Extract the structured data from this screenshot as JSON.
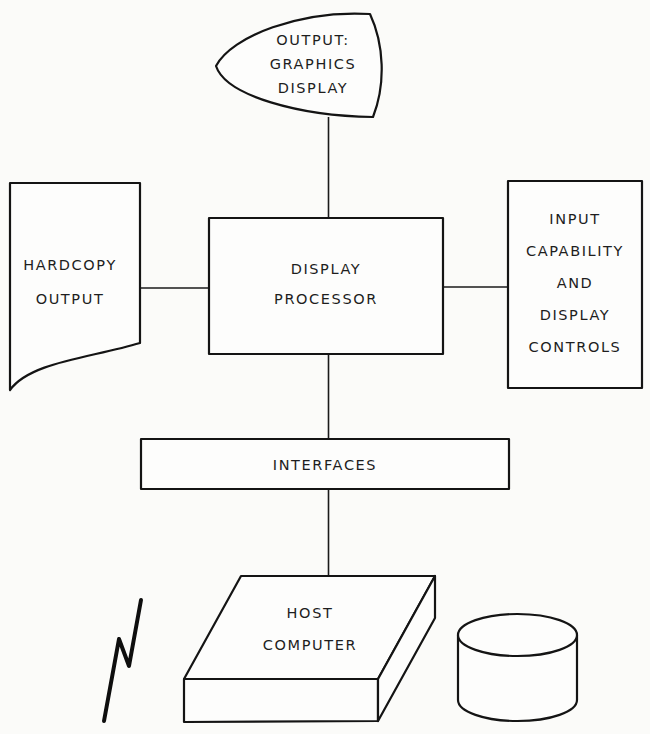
{
  "diagram": {
    "nodes": {
      "graphics_display": {
        "shape": "crt-display",
        "lines": [
          "OUTPUT:",
          "GRAPHICS",
          "DISPLAY"
        ]
      },
      "hardcopy": {
        "shape": "document",
        "lines": [
          "HARDCOPY",
          "OUTPUT"
        ]
      },
      "display_processor": {
        "shape": "rectangle",
        "lines": [
          "DISPLAY",
          "PROCESSOR"
        ]
      },
      "input_controls": {
        "shape": "rectangle",
        "lines": [
          "INPUT",
          "CAPABILITY",
          "AND",
          "DISPLAY",
          "CONTROLS"
        ]
      },
      "interfaces": {
        "shape": "rectangle",
        "lines": [
          "INTERFACES"
        ]
      },
      "host_computer": {
        "shape": "3d-box",
        "lines": [
          "HOST",
          "COMPUTER"
        ]
      },
      "communication_link": {
        "shape": "lightning-bolt",
        "lines": []
      },
      "disk_storage": {
        "shape": "cylinder",
        "lines": []
      }
    },
    "edges": [
      {
        "from": "graphics_display",
        "to": "display_processor"
      },
      {
        "from": "hardcopy",
        "to": "display_processor"
      },
      {
        "from": "display_processor",
        "to": "input_controls"
      },
      {
        "from": "display_processor",
        "to": "interfaces"
      },
      {
        "from": "interfaces",
        "to": "host_computer"
      }
    ],
    "colors": {
      "line": "#141414",
      "background": "#fbfbf9"
    }
  }
}
